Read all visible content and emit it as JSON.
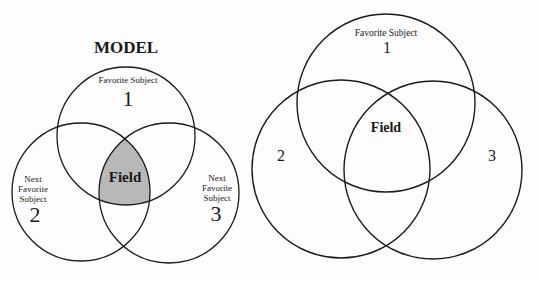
{
  "colors": {
    "background": "#fdfdfd",
    "stroke": "#1a1a1a",
    "field_fill": "#b8b8b8"
  },
  "model_diagram": {
    "title": "MODEL",
    "circle1": {
      "label": "Favorite Subject",
      "number": "1"
    },
    "circle2": {
      "label_line1": "Next",
      "label_line2": "Favorite",
      "label_line3": "Subject",
      "number": "2"
    },
    "circle3": {
      "label_line1": "Next",
      "label_line2": "Favorite",
      "label_line3": "Subject",
      "number": "3"
    },
    "center_label": "Field"
  },
  "right_diagram": {
    "circle1": {
      "label": "Favorite Subject",
      "number": "1"
    },
    "circle2": {
      "number": "2"
    },
    "circle3": {
      "number": "3"
    },
    "center_label": "Field"
  }
}
